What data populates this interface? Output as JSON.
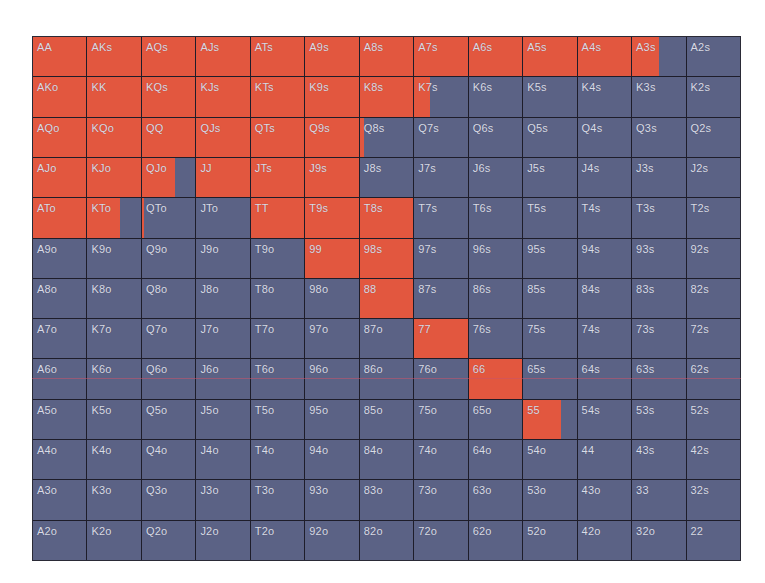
{
  "chart_data": {
    "type": "heatmap",
    "title": "",
    "colors": {
      "in_range": "#e2573f",
      "out_of_range": "#5b6285",
      "grid_line": "#1e1d2a",
      "label": "#d9dbe6"
    },
    "rows": [
      [
        "AA",
        "AKs",
        "AQs",
        "AJs",
        "ATs",
        "A9s",
        "A8s",
        "A7s",
        "A6s",
        "A5s",
        "A4s",
        "A3s",
        "A2s"
      ],
      [
        "AKo",
        "KK",
        "KQs",
        "KJs",
        "KTs",
        "K9s",
        "K8s",
        "K7s",
        "K6s",
        "K5s",
        "K4s",
        "K3s",
        "K2s"
      ],
      [
        "AQo",
        "KQo",
        "QQ",
        "QJs",
        "QTs",
        "Q9s",
        "Q8s",
        "Q7s",
        "Q6s",
        "Q5s",
        "Q4s",
        "Q3s",
        "Q2s"
      ],
      [
        "AJo",
        "KJo",
        "QJo",
        "JJ",
        "JTs",
        "J9s",
        "J8s",
        "J7s",
        "J6s",
        "J5s",
        "J4s",
        "J3s",
        "J2s"
      ],
      [
        "ATo",
        "KTo",
        "QTo",
        "JTo",
        "TT",
        "T9s",
        "T8s",
        "T7s",
        "T6s",
        "T5s",
        "T4s",
        "T3s",
        "T2s"
      ],
      [
        "A9o",
        "K9o",
        "Q9o",
        "J9o",
        "T9o",
        "99",
        "98s",
        "97s",
        "96s",
        "95s",
        "94s",
        "93s",
        "92s"
      ],
      [
        "A8o",
        "K8o",
        "Q8o",
        "J8o",
        "T8o",
        "98o",
        "88",
        "87s",
        "86s",
        "85s",
        "84s",
        "83s",
        "82s"
      ],
      [
        "A7o",
        "K7o",
        "Q7o",
        "J7o",
        "T7o",
        "97o",
        "87o",
        "77",
        "76s",
        "75s",
        "74s",
        "73s",
        "72s"
      ],
      [
        "A6o",
        "K6o",
        "Q6o",
        "J6o",
        "T6o",
        "96o",
        "86o",
        "76o",
        "66",
        "65s",
        "64s",
        "63s",
        "62s"
      ],
      [
        "A5o",
        "K5o",
        "Q5o",
        "J5o",
        "T5o",
        "95o",
        "85o",
        "75o",
        "65o",
        "55",
        "54s",
        "53s",
        "52s"
      ],
      [
        "A4o",
        "K4o",
        "Q4o",
        "J4o",
        "T4o",
        "94o",
        "84o",
        "74o",
        "64o",
        "54o",
        "44",
        "43s",
        "42s"
      ],
      [
        "A3o",
        "K3o",
        "Q3o",
        "J3o",
        "T3o",
        "93o",
        "83o",
        "73o",
        "63o",
        "53o",
        "43o",
        "33",
        "32s"
      ],
      [
        "A2o",
        "K2o",
        "Q2o",
        "J2o",
        "T2o",
        "92o",
        "82o",
        "72o",
        "62o",
        "52o",
        "42o",
        "32o",
        "22"
      ]
    ],
    "fill": [
      [
        1,
        1,
        1,
        1,
        1,
        1,
        1,
        1,
        1,
        1,
        1,
        0.5,
        0
      ],
      [
        1,
        1,
        1,
        1,
        1,
        1,
        1,
        0.3,
        0,
        0,
        0,
        0,
        0
      ],
      [
        1,
        1,
        1,
        1,
        1,
        1,
        0.08,
        0,
        0,
        0,
        0,
        0,
        0
      ],
      [
        1,
        1,
        0.62,
        1,
        1,
        1,
        0,
        0,
        0,
        0,
        0,
        0,
        0
      ],
      [
        1,
        0.6,
        0.03,
        0,
        1,
        1,
        1,
        0,
        0,
        0,
        0,
        0,
        0
      ],
      [
        0,
        0,
        0,
        0,
        0,
        1,
        1,
        0,
        0,
        0,
        0,
        0,
        0
      ],
      [
        0,
        0,
        0,
        0,
        0,
        0,
        1,
        0,
        0,
        0,
        0,
        0,
        0
      ],
      [
        0,
        0,
        0,
        0,
        0,
        0,
        0,
        1,
        0,
        0,
        0,
        0,
        0
      ],
      [
        0,
        0,
        0,
        0,
        0,
        0,
        0,
        0,
        1,
        0,
        0,
        0,
        0
      ],
      [
        0,
        0,
        0,
        0,
        0,
        0,
        0,
        0,
        0,
        0.7,
        0,
        0,
        0
      ],
      [
        0,
        0,
        0,
        0,
        0,
        0,
        0,
        0,
        0,
        0,
        0,
        0,
        0
      ],
      [
        0,
        0,
        0,
        0,
        0,
        0,
        0,
        0,
        0,
        0,
        0,
        0,
        0
      ],
      [
        0,
        0,
        0,
        0,
        0,
        0,
        0,
        0,
        0,
        0,
        0,
        0,
        0
      ]
    ],
    "grid": true,
    "legend": null
  }
}
